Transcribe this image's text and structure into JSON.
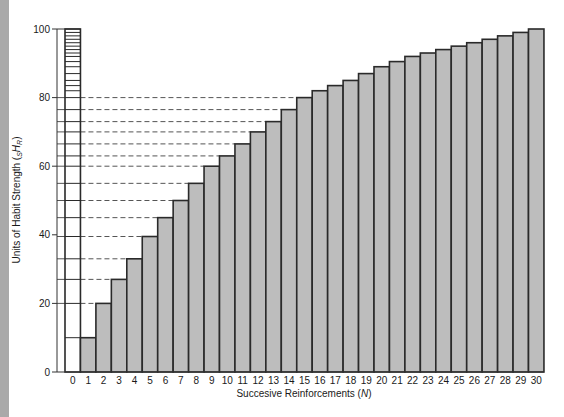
{
  "chart_data": {
    "type": "bar",
    "title": "",
    "xlabel": "Succesive Reinforcements (N)",
    "ylabel": "Units of Habit Strength (sHR)",
    "xlabel_parts": {
      "text": "Succesive Reinforcements (",
      "italic": "N",
      "close": ")"
    },
    "ylabel_parts": {
      "text": "Units of Habit Strength (",
      "sub": "S",
      "italic": "H",
      "sub2": "R",
      "close": ")"
    },
    "categories": [
      "0",
      "1",
      "2",
      "3",
      "4",
      "5",
      "6",
      "7",
      "8",
      "9",
      "10",
      "11",
      "12",
      "13",
      "14",
      "15",
      "16",
      "17",
      "18",
      "19",
      "20",
      "21",
      "22",
      "23",
      "24",
      "25",
      "26",
      "27",
      "28",
      "29",
      "30"
    ],
    "values": [
      100,
      10,
      20,
      27,
      33,
      39.5,
      45,
      50,
      55,
      60,
      63,
      66.5,
      70,
      73,
      76.5,
      80,
      82,
      83.5,
      85,
      87,
      89,
      90.5,
      92,
      93,
      94,
      95,
      96,
      97,
      98,
      99,
      100
    ],
    "ylim": [
      0,
      100
    ],
    "yticks": [
      0,
      20,
      40,
      60,
      80,
      100
    ],
    "grid": false,
    "legend": null,
    "colors": {
      "bar_fill": "#bdbdbd",
      "bar_edge": "#2a2a2a",
      "reference_fill": "#ffffff",
      "dash": "#555555",
      "edge_stripe": "#a9a9a9"
    }
  }
}
